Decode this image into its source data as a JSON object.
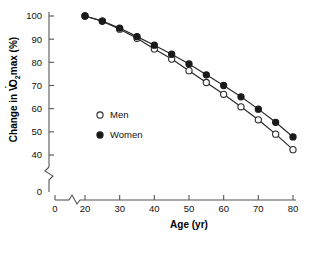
{
  "chart_data": {
    "type": "line",
    "title": "",
    "xlabel": "Age (yr)",
    "ylabel": "Change in VO2max (%)",
    "ylabel_parts": {
      "pre": "Change in V",
      "dot_over": "V",
      "sub": "2",
      "post": "max (%)",
      "mid": "O"
    },
    "x": [
      20,
      25,
      30,
      35,
      40,
      45,
      50,
      55,
      60,
      65,
      70,
      75,
      80
    ],
    "xlim": [
      20,
      80
    ],
    "ylim": [
      40,
      100
    ],
    "xticks": [
      0,
      20,
      30,
      40,
      50,
      60,
      70,
      80
    ],
    "yticks": [
      0,
      40,
      50,
      60,
      70,
      80,
      90,
      100
    ],
    "xtick_labels": [
      "0",
      "20",
      "30",
      "40",
      "50",
      "60",
      "70",
      "80"
    ],
    "ytick_labels": [
      "0",
      "40",
      "50",
      "60",
      "70",
      "80",
      "90",
      "100"
    ],
    "axis_break_x": true,
    "axis_break_y": true,
    "grid": false,
    "legend_position": "center-left",
    "series": [
      {
        "name": "Men",
        "marker": "open-circle",
        "color": "#1a1a1a",
        "values": [
          100,
          97.8,
          94.3,
          90.4,
          85.8,
          81.4,
          76.4,
          71.3,
          66.2,
          60.8,
          55.2,
          49.0,
          42.3
        ]
      },
      {
        "name": "Women",
        "marker": "filled-circle",
        "color": "#1a1a1a",
        "values": [
          100,
          97.8,
          94.8,
          91.1,
          87.4,
          83.5,
          79.3,
          74.6,
          70.0,
          65.1,
          59.8,
          54.1,
          47.8
        ]
      }
    ]
  },
  "legend": {
    "items": [
      {
        "label": "Men",
        "marker": "open-circle"
      },
      {
        "label": "Women",
        "marker": "filled-circle"
      }
    ]
  }
}
